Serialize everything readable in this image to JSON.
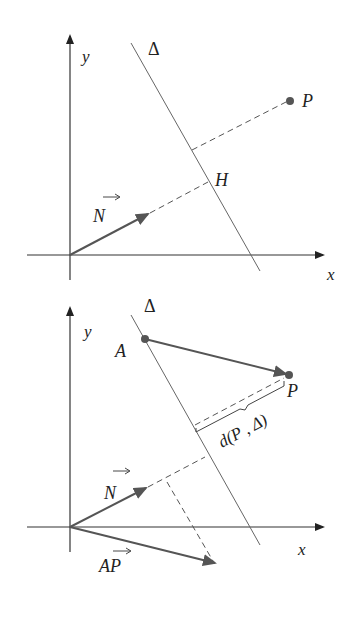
{
  "figure_top": {
    "axis_x_label": "x",
    "axis_y_label": "y",
    "line_label": "Δ",
    "point_P_label": "P",
    "foot_label": "H",
    "normal_vector_label": "N"
  },
  "figure_bottom": {
    "axis_x_label": "x",
    "axis_y_label": "y",
    "line_label": "Δ",
    "point_A_label": "A",
    "point_P_label": "P",
    "distance_label": "d(P , Δ)",
    "normal_vector_label": "N",
    "ap_vector_label": "AP"
  },
  "colors": {
    "axis": "#2a2a2a",
    "line": "#555555",
    "vector": "#444444",
    "point": "#555555"
  }
}
